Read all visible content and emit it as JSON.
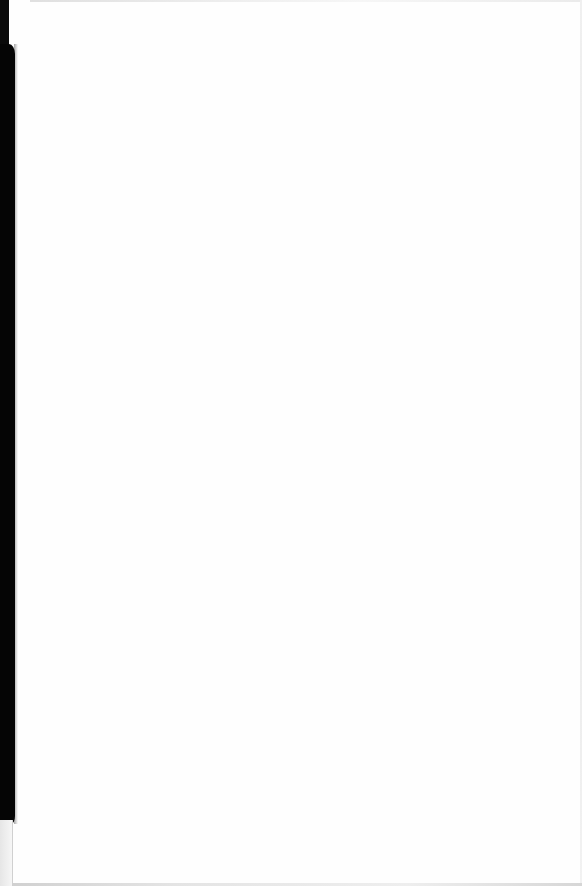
{
  "document": {
    "type": "scanned-page",
    "page_text": "",
    "background_color": "#ffffff",
    "binding_shadow_color": "#050505"
  }
}
